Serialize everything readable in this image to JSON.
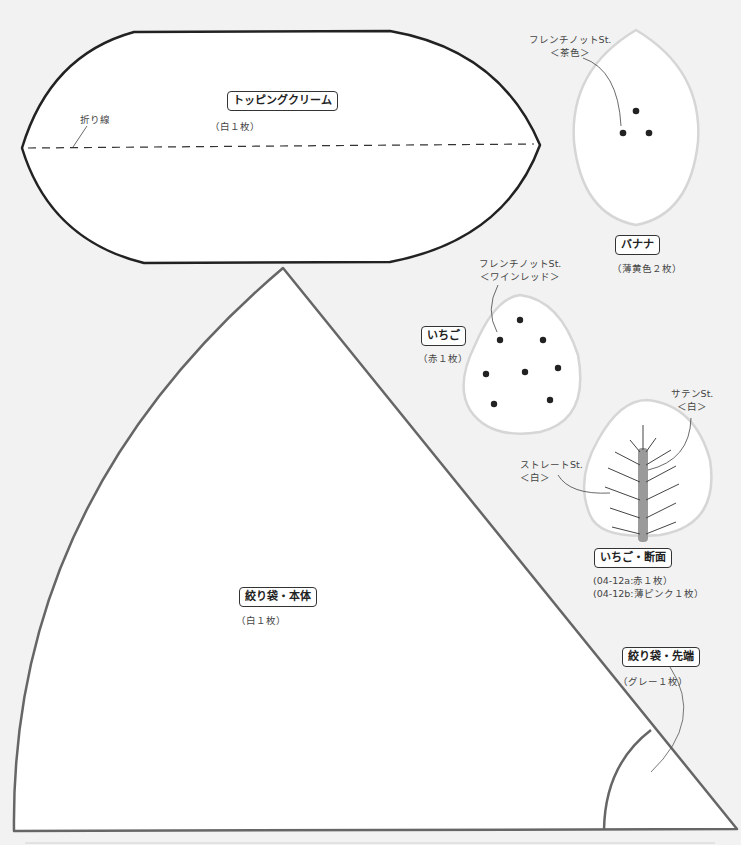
{
  "colors": {
    "background": "#f2f2f2",
    "piece_fill": "#ffffff",
    "outline_dark": "#222222",
    "outline_gray": "#666666",
    "outline_light": "#d6d6d6",
    "stitch_bar": "#9a9a9a",
    "dot": "#222222"
  },
  "pieces": {
    "topping_cream": {
      "title": "トッピングクリーム",
      "count": "（白１枚）",
      "fold_line_label": "折り線"
    },
    "banana": {
      "title": "バナナ",
      "count": "（薄黄色２枚）",
      "stitch_label_1": "フレンチノットSt.",
      "stitch_label_2": "＜茶色＞"
    },
    "strawberry": {
      "title": "いちご",
      "count": "（赤１枚）",
      "stitch_label_1": "フレンチノットSt.",
      "stitch_label_2": "＜ワインレッド＞"
    },
    "strawberry_section": {
      "title": "いちご・断面",
      "count_a": "(04-12a:赤１枚）",
      "count_b": "(04-12b:薄ピンク１枚）",
      "satin_label_1": "サテンSt.",
      "satin_label_2": "＜白＞",
      "straight_label_1": "ストレートSt.",
      "straight_label_2": "＜白＞"
    },
    "piping_bag_body": {
      "title": "絞り袋・本体",
      "count": "（白１枚）"
    },
    "piping_bag_tip": {
      "title": "絞り袋・先端",
      "count": "（グレー１枚）"
    }
  }
}
